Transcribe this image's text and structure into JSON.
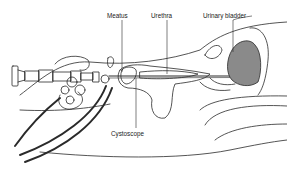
{
  "diagram": {
    "labels": {
      "meatus": "Meatus",
      "urethra": "Urethra",
      "urinary_bladder": "Urinary bladder",
      "cystoscope": "Cystoscope"
    },
    "colors": {
      "line": "#2a2a2a",
      "bladder_fill": "#8a8a8a",
      "background": "#ffffff"
    }
  }
}
